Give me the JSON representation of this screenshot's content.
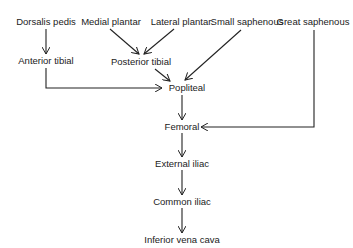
{
  "nodes": {
    "dorsalis_pedis": {
      "label": "Dorsalis pedis",
      "x": 46,
      "y": 22
    },
    "medial_plantar": {
      "label": "Medial plantar",
      "x": 111,
      "y": 22
    },
    "lateral_plantar": {
      "label": "Lateral plantar",
      "x": 181,
      "y": 22
    },
    "small_saphenous": {
      "label": "Small saphenous",
      "x": 247,
      "y": 22
    },
    "great_saphenous": {
      "label": "Great saphenous",
      "x": 313,
      "y": 22
    },
    "anterior_tibial": {
      "label": "Anterior tibial",
      "x": 46,
      "y": 61
    },
    "posterior_tibial": {
      "label": "Posterior tibial",
      "x": 141,
      "y": 62
    },
    "popliteal": {
      "label": "Popliteal",
      "x": 193,
      "y": 88
    },
    "femoral": {
      "label": "Femoral",
      "x": 182,
      "y": 127
    },
    "external_iliac": {
      "label": "External iliac",
      "x": 182,
      "y": 164
    },
    "common_iliac": {
      "label": "Common iliac",
      "x": 182,
      "y": 202
    },
    "inferior_vena_cava": {
      "label": "Inferior vena cava",
      "x": 182,
      "y": 240
    }
  },
  "edges": [
    [
      "dorsalis_pedis",
      "anterior_tibial"
    ],
    [
      "medial_plantar",
      "posterior_tibial"
    ],
    [
      "lateral_plantar",
      "posterior_tibial"
    ],
    [
      "anterior_tibial",
      "popliteal"
    ],
    [
      "posterior_tibial",
      "popliteal"
    ],
    [
      "small_saphenous",
      "popliteal"
    ],
    [
      "popliteal",
      "femoral"
    ],
    [
      "great_saphenous",
      "femoral"
    ],
    [
      "femoral",
      "external_iliac"
    ],
    [
      "external_iliac",
      "common_iliac"
    ],
    [
      "common_iliac",
      "inferior_vena_cava"
    ]
  ]
}
